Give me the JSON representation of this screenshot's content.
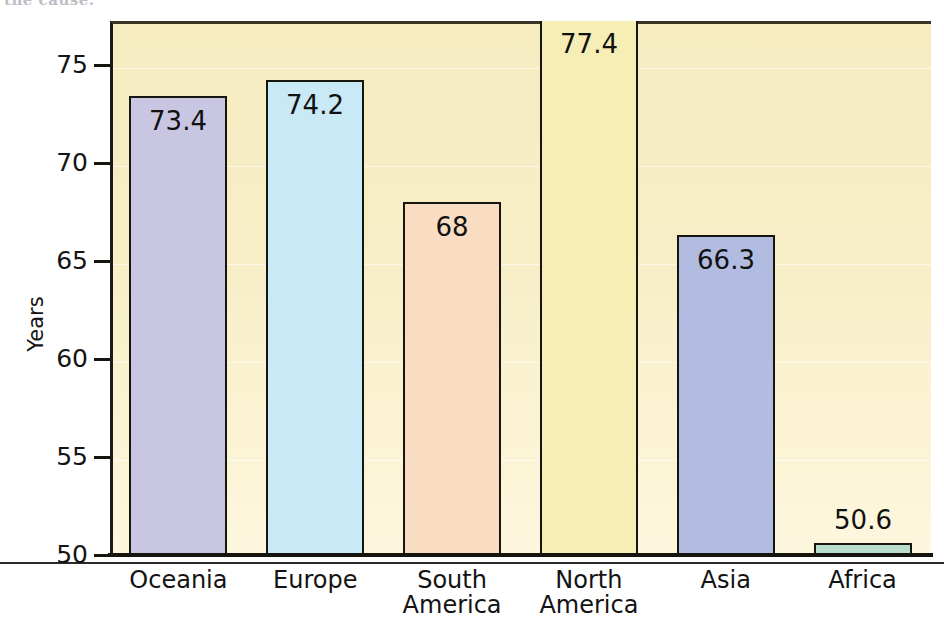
{
  "top_caption": "the cause.",
  "chart_data": {
    "type": "bar",
    "title": "",
    "subtitle": "",
    "xlabel": "",
    "ylabel": "Years",
    "ylim": [
      50,
      77.8
    ],
    "yticks": [
      50,
      55,
      60,
      65,
      70,
      75
    ],
    "ytick_labels": [
      "50",
      "55",
      "60",
      "65",
      "70",
      "75"
    ],
    "grid": true,
    "legend": "none",
    "plot_background": "#f7eec7",
    "categories": [
      "Oceania",
      "Europe",
      "South America",
      "North America",
      "Asia",
      "Africa"
    ],
    "values": [
      73.4,
      74.2,
      68,
      66.3,
      50.6,
      77.4
    ],
    "bars": [
      {
        "category": "Oceania",
        "label_lines": [
          "Oceania"
        ],
        "value": 73.4,
        "value_label": "73.4",
        "color": "#c9c6e2",
        "label_position": "inside"
      },
      {
        "category": "Europe",
        "label_lines": [
          "Europe"
        ],
        "value": 74.2,
        "value_label": "74.2",
        "color": "#c9e9f6",
        "label_position": "inside"
      },
      {
        "category": "South America",
        "label_lines": [
          "South",
          "America"
        ],
        "value": 68.0,
        "value_label": "68",
        "color": "#f8ddc3",
        "label_position": "inside"
      },
      {
        "category": "North America",
        "label_lines": [
          "North",
          "America"
        ],
        "value": 77.4,
        "value_label": "77.4",
        "color": "#f7eeb6",
        "label_position": "inside"
      },
      {
        "category": "Asia",
        "label_lines": [
          "Asia"
        ],
        "value": 66.3,
        "value_label": "66.3",
        "color": "#b2bbe0",
        "label_position": "inside"
      },
      {
        "category": "Africa",
        "label_lines": [
          "Africa"
        ],
        "value": 50.6,
        "value_label": "50.6",
        "color": "#b9ddcf",
        "label_position": "above"
      }
    ]
  }
}
